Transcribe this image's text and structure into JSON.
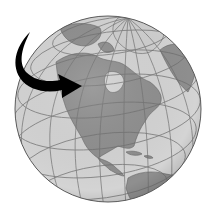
{
  "illustration": {
    "subject": "globe",
    "view": "North America",
    "style": "grayscale",
    "colors": {
      "background": "#ffffff",
      "ocean": "#d4d4d4",
      "land": "#8f8f8f",
      "ice": "#cfcfcf",
      "gridlines": "#6e6e6e",
      "outline": "#5a5a5a",
      "arrow": "#000000"
    },
    "globe": {
      "cx": 108,
      "cy": 109,
      "r": 93
    },
    "arrow": {
      "direction": "curving down and right",
      "points_to": "western Canada"
    }
  }
}
